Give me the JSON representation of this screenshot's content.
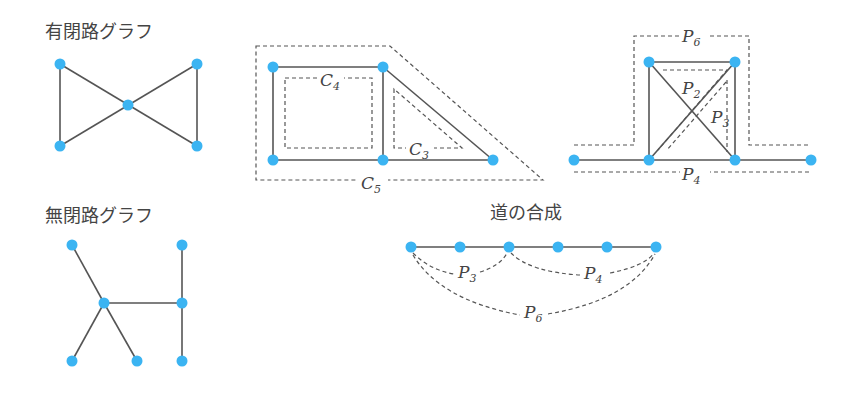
{
  "colors": {
    "node": "#3bb4f2",
    "edge": "#555555",
    "text": "#444444"
  },
  "titles": {
    "cyclic_graph": "有閉路グラフ",
    "acyclic_graph": "無閉路グラフ",
    "path_composition": "道の合成"
  },
  "cycles_figure": {
    "labels": [
      {
        "letter": "C",
        "sub": "4"
      },
      {
        "letter": "C",
        "sub": "3"
      },
      {
        "letter": "C",
        "sub": "5"
      }
    ]
  },
  "paths_figure": {
    "labels": [
      {
        "letter": "P",
        "sub": "6"
      },
      {
        "letter": "P",
        "sub": "2"
      },
      {
        "letter": "P",
        "sub": "3"
      },
      {
        "letter": "P",
        "sub": "4"
      }
    ]
  },
  "composition_figure": {
    "labels": [
      {
        "letter": "P",
        "sub": "3"
      },
      {
        "letter": "P",
        "sub": "4"
      },
      {
        "letter": "P",
        "sub": "6"
      }
    ]
  }
}
